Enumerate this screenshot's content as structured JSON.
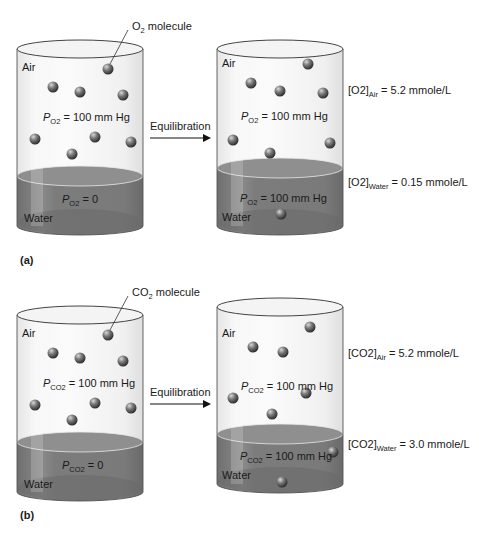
{
  "panels": [
    {
      "label": "(a)",
      "gas": "O",
      "gas_sub": "2",
      "molecule_label": "molecule",
      "arrow_label": "Equilibration",
      "before": {
        "air_label": "Air",
        "water_label": "Water",
        "air_pressure": "= 100 mm Hg",
        "water_pressure": "= 0",
        "air_molecules": 8,
        "water_molecules": 0
      },
      "after": {
        "air_label": "Air",
        "water_label": "Water",
        "air_pressure": "= 100 mm Hg",
        "water_pressure": "= 100 mm Hg",
        "air_molecules": 7,
        "water_molecules": 1,
        "air_conc_sub": "Air",
        "air_conc_value": "= 5.2 mmole/L",
        "water_conc_sub": "Water",
        "water_conc_value": "= 0.15 mmole/L"
      }
    },
    {
      "label": "(b)",
      "gas": "CO",
      "gas_sub": "2",
      "molecule_label": "molecule",
      "arrow_label": "Equilibration",
      "before": {
        "air_label": "Air",
        "water_label": "Water",
        "air_pressure": "= 100 mm Hg",
        "water_pressure": "= 0",
        "air_molecules": 8,
        "water_molecules": 0
      },
      "after": {
        "air_label": "Air",
        "water_label": "Water",
        "air_pressure": "= 100 mm Hg",
        "water_pressure": "= 100 mm Hg",
        "air_molecules": 6,
        "water_molecules": 2,
        "air_conc_sub": "Air",
        "air_conc_value": "= 5.2 mmole/L",
        "water_conc_sub": "Water",
        "water_conc_value": "= 3.0 mmole/L"
      }
    }
  ],
  "colors": {
    "water": "#7a7a7a",
    "water_surface": "#9a9a9a",
    "cylinder_edge": "#555555",
    "molecule": "#6a6a6a"
  }
}
